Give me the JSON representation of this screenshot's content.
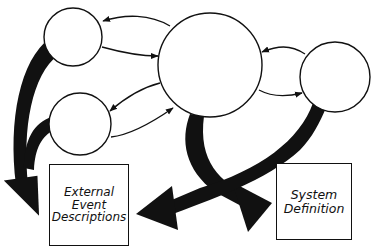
{
  "diagram": {
    "type": "flow-diagram",
    "colors": {
      "stroke": "#111111",
      "background": "#ffffff",
      "thick_arrow": "#111111"
    },
    "nodes": [
      {
        "id": "process-a",
        "shape": "circle",
        "label": ""
      },
      {
        "id": "process-b",
        "shape": "circle",
        "label": ""
      },
      {
        "id": "process-c",
        "shape": "circle",
        "label": ""
      },
      {
        "id": "process-d",
        "shape": "circle",
        "label": ""
      }
    ],
    "outputs": {
      "external_events": {
        "lines": [
          "External",
          "Event",
          "Descriptions"
        ]
      },
      "system_definition": {
        "lines": [
          "System",
          "Definition"
        ]
      }
    },
    "edges": [
      {
        "from": "process-c",
        "to": "process-a",
        "style": "thin-arrow"
      },
      {
        "from": "process-a",
        "to": "process-c",
        "style": "thin-arrow"
      },
      {
        "from": "process-c",
        "to": "process-b",
        "style": "thin-arrow"
      },
      {
        "from": "process-b",
        "to": "process-c",
        "style": "thin-arrow"
      },
      {
        "from": "process-d",
        "to": "process-c",
        "style": "thin-arrow"
      },
      {
        "from": "process-c",
        "to": "process-d",
        "style": "thin-arrow"
      },
      {
        "from": "process-a",
        "to": "external_events",
        "style": "thick-arrow"
      },
      {
        "from": "process-b",
        "to": "external_events",
        "style": "thick-arrow"
      },
      {
        "from": "process-c",
        "to": "system_definition",
        "style": "thick-arrow"
      },
      {
        "from": "process-d",
        "to": "external_events",
        "style": "thick-arrow"
      }
    ]
  }
}
